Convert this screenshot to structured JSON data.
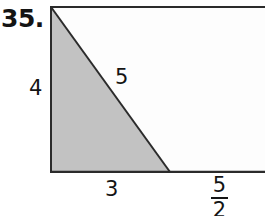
{
  "problem": {
    "number_label": "35."
  },
  "figure": {
    "shape_description": "rectangle-with-shaded-right-triangle",
    "fill_color_shaded": "#c2c2c2",
    "fill_color_unshaded": "#fdfdfd",
    "stroke_color": "#2b2b2b",
    "labels": {
      "height": "4",
      "hypotenuse": "5",
      "triangle_base": "3",
      "remaining_base_numerator": "5",
      "remaining_base_denominator": "2"
    },
    "geometry": {
      "rect_left": 0,
      "rect_top": 0,
      "rect_right": 215,
      "rect_bottom": 166,
      "triangle_apex_x": 1,
      "triangle_apex_y": 1,
      "triangle_base_end_x": 120,
      "triangle_base_end_y": 166
    }
  }
}
